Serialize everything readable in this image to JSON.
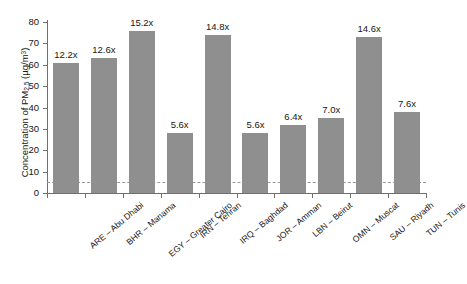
{
  "chart_data": {
    "type": "bar",
    "title": "",
    "xlabel": "",
    "ylabel": "Concentration of PM2.5 (µg/m³)",
    "ylabel_parts": {
      "prefix": "Concentration of PM",
      "subscript": "2.5",
      "suffix_open": " (µg/m",
      "superscript": "3",
      "suffix_close": ")"
    },
    "categories": [
      "ARE – Abu Dhabi",
      "BHR – Manama",
      "EGY – Greater Cairo",
      "IRN – Tehran",
      "IRQ – Baghdad",
      "JOR – Amman",
      "LBN – Beirut",
      "OMN – Muscat",
      "SAU – Riyadh",
      "TUN – Tunis"
    ],
    "values": [
      61,
      63,
      76,
      28,
      74,
      28,
      32,
      35,
      73,
      38
    ],
    "data_labels": [
      "12.2x",
      "12.6x",
      "15.2x",
      "5.6x",
      "14.8x",
      "5.6x",
      "6.4x",
      "7.0x",
      "14.6x",
      "7.6x"
    ],
    "ylim": [
      0,
      80
    ],
    "yticks": [
      0,
      10,
      20,
      30,
      40,
      50,
      60,
      70,
      80
    ],
    "ytick_labels": [
      "0",
      "10",
      "20",
      "30",
      "40",
      "50",
      "60",
      "70",
      "80"
    ],
    "grid": false,
    "legend": "none",
    "reference_line": {
      "value": 5,
      "style": "dashed",
      "color": "#9a9a9a"
    },
    "bar_color": "#8f8f8f",
    "axis_color": "#6f6f6f",
    "text_color": "#161616",
    "background": "#ffffff"
  }
}
